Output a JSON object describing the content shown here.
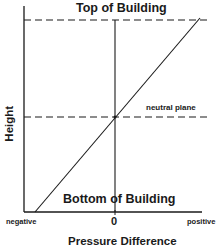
{
  "diagram": {
    "labels": {
      "top": "Top of Building",
      "bottom": "Bottom of Building",
      "neutral_plane": "neutral plane",
      "y_axis": "Height",
      "x_axis": "Pressure Difference"
    },
    "x_ticks": {
      "negative": "negative",
      "zero": "0",
      "positive": "positive"
    },
    "colors": {
      "line": "#1a1a1a",
      "background": "#ffffff"
    }
  }
}
